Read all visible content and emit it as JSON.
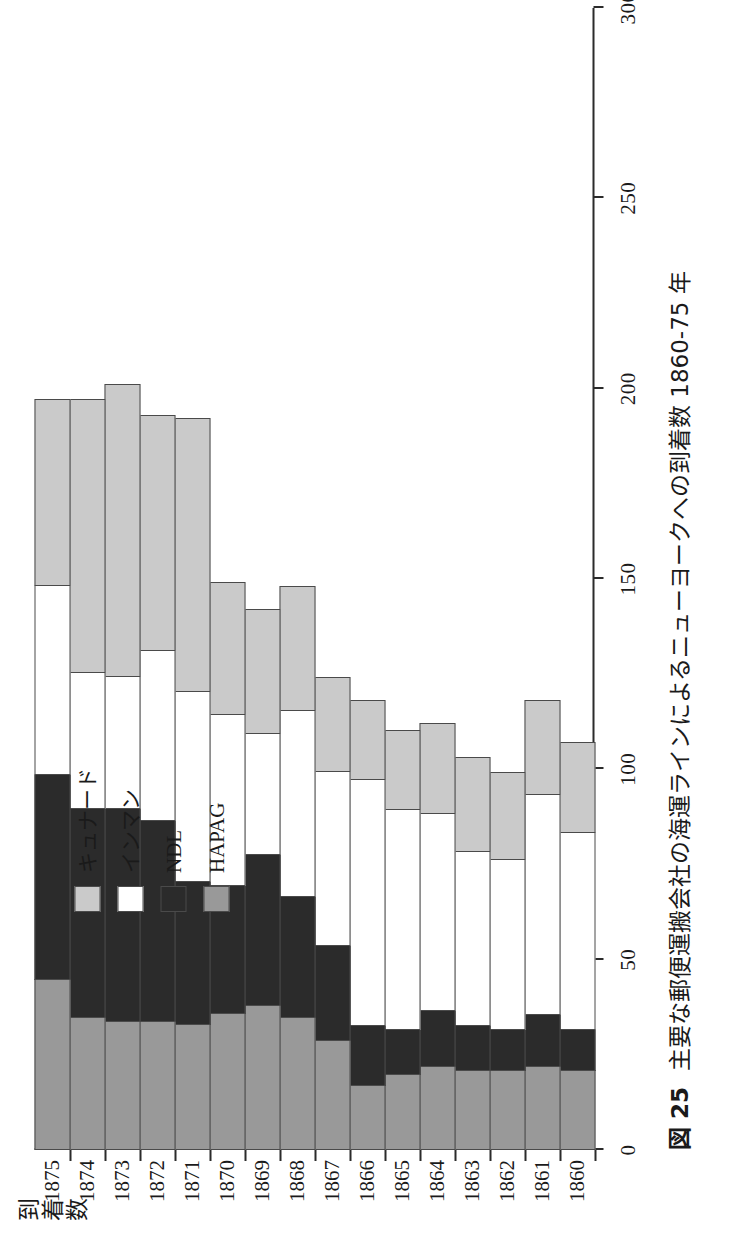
{
  "figure": {
    "number_label": "図 25",
    "caption": "主要な郵便運搬会社の海運ラインによるニューヨークへの到着数 1860-75 年",
    "value_axis_title": "到着数"
  },
  "legend": {
    "position": "top-left-inside",
    "items": [
      {
        "label": "キュナード",
        "color": "#cacaca",
        "script": "kana"
      },
      {
        "label": "インマン",
        "color": "#ffffff",
        "script": "kana"
      },
      {
        "label": "NDL",
        "color": "#2b2b2b",
        "script": "latin"
      },
      {
        "label": "HAPAG",
        "color": "#999999",
        "script": "latin"
      }
    ]
  },
  "axis": {
    "value_ticks": [
      "0",
      "50",
      "100",
      "150",
      "200",
      "250",
      "300"
    ],
    "value_min": 0,
    "value_max": 300,
    "value_step": 50,
    "grid": false
  },
  "chart_data": {
    "type": "bar",
    "orientation": "vertical-stacked",
    "title": "主要な郵便運搬会社の海運ラインによるニューヨークへの到着数 1860-75 年",
    "xlabel": "",
    "ylabel": "到着数",
    "ylim": [
      0,
      300
    ],
    "grid": false,
    "legend_position": "top-left-inside",
    "categories": [
      "1860",
      "1861",
      "1862",
      "1863",
      "1864",
      "1865",
      "1866",
      "1867",
      "1868",
      "1869",
      "1870",
      "1871",
      "1872",
      "1873",
      "1874",
      "1875"
    ],
    "series": [
      {
        "name": "HAPAG",
        "color": "#999999",
        "values": [
          21,
          22,
          21,
          21,
          22,
          20,
          17,
          29,
          35,
          38,
          36,
          33,
          34,
          34,
          35,
          45
        ]
      },
      {
        "name": "NDL",
        "color": "#2b2b2b",
        "values": [
          11,
          14,
          11,
          12,
          15,
          12,
          16,
          25,
          32,
          40,
          34,
          38,
          53,
          56,
          55,
          54
        ]
      },
      {
        "name": "インマン",
        "color": "#ffffff",
        "values": [
          52,
          58,
          45,
          46,
          52,
          58,
          65,
          46,
          49,
          32,
          45,
          50,
          45,
          35,
          36,
          50
        ]
      },
      {
        "name": "キュナード",
        "color": "#cacaca",
        "values": [
          24,
          25,
          23,
          25,
          24,
          21,
          21,
          25,
          33,
          33,
          35,
          72,
          62,
          77,
          72,
          49
        ]
      }
    ],
    "totals": [
      108,
      119,
      100,
      104,
      113,
      111,
      119,
      125,
      149,
      143,
      150,
      193,
      194,
      202,
      198,
      198
    ]
  },
  "style": {
    "segment_border": "#4a4a4a",
    "axis_color": "#2b2b2b",
    "background": "#ffffff"
  }
}
